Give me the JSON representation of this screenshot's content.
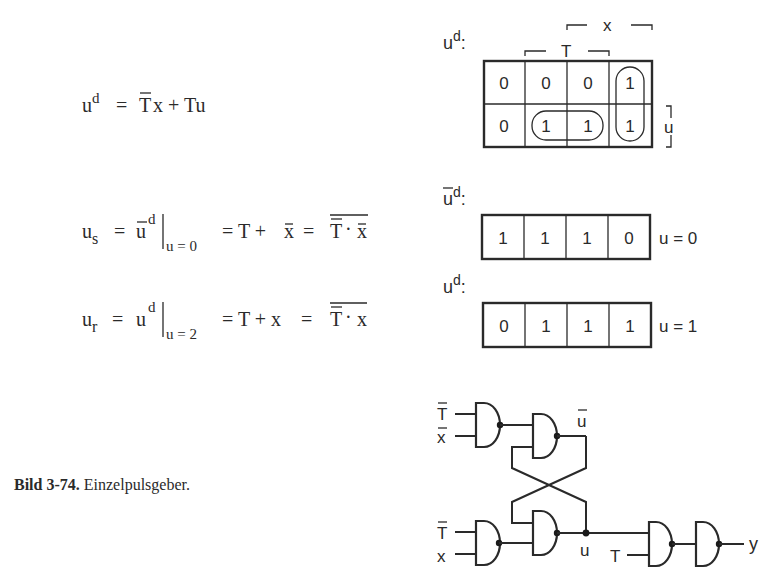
{
  "equations": {
    "ud": {
      "lhs": "u",
      "lhs_sup": "d",
      "rhs_tbar": "T",
      "rhs_rest": "x + Tu"
    },
    "us": {
      "lhs": "u",
      "lhs_sub": "s",
      "eq1": "=",
      "u_bar": "u",
      "sup": "d",
      "eval_sub": "u = 0",
      "mid": "= T + ",
      "x_bar": "x",
      "eq3": "=",
      "T_dbl_bar": "T",
      "dot": "·",
      "x_bar2": "x"
    },
    "ur": {
      "lhs": "u",
      "lhs_sub": "r",
      "eq1": "=",
      "u": "u",
      "sup": "d",
      "eval_sub": "u = 2",
      "mid": "= T + x",
      "eq3": "=",
      "T_dbl_bar": "T",
      "dot": "·",
      "x": "x"
    }
  },
  "kmap": {
    "label": "u",
    "label_sup": "d",
    "label_colon": ":",
    "col_labels": {
      "T": "T",
      "x": "x"
    },
    "row_label": "u",
    "rows": [
      [
        "0",
        "0",
        "0",
        "1"
      ],
      [
        "0",
        "1",
        "1",
        "1"
      ]
    ]
  },
  "kmap_u0": {
    "label": "u",
    "label_sup": "d",
    "label_colon": ":",
    "cells": [
      "1",
      "1",
      "1",
      "0"
    ],
    "condition": "u = 0"
  },
  "kmap_u1": {
    "label": "u",
    "label_sup": "d",
    "label_colon": ":",
    "cells": [
      "0",
      "1",
      "1",
      "1"
    ],
    "condition": "u = 1"
  },
  "circuit": {
    "in_g1_a": "T",
    "in_g1_b": "x",
    "in_g3_a": "T",
    "in_g3_b": "x",
    "q_bar": "u",
    "q": "u",
    "in_g5_b": "T",
    "output": "y"
  },
  "caption": {
    "number": "Bild 3-74.",
    "text": " Einzelpulsgeber."
  }
}
